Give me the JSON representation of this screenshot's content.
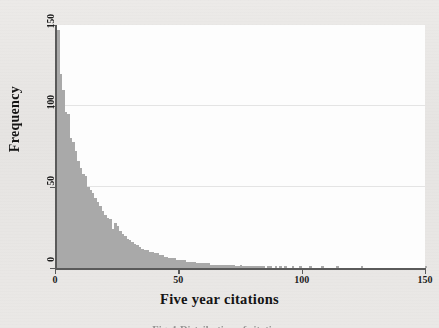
{
  "figure": {
    "caption": "Fig. 1 Distribution of citations",
    "background_color": "#e8e7e5",
    "plot_background_color": "#fdfdfd",
    "bar_color": "#a9a9a9",
    "axis_color": "#5a5a5a"
  },
  "axes": {
    "x_title": "Five year citations",
    "y_title": "Frequency",
    "x_ticks": [
      "0",
      "50",
      "100",
      "150"
    ],
    "y_ticks": [
      "0",
      "50",
      "100",
      "150"
    ]
  },
  "chart_data": {
    "type": "bar",
    "title": "",
    "subtitle": "",
    "xlabel": "Five year citations",
    "ylabel": "Frequency",
    "xlim": [
      0,
      150
    ],
    "ylim": [
      0,
      150
    ],
    "grid": true,
    "gridlines_y": [
      50,
      100
    ],
    "legend": null,
    "legend_position": "none",
    "bin_width": 1,
    "x": [
      0,
      1,
      2,
      3,
      4,
      5,
      6,
      7,
      8,
      9,
      10,
      11,
      12,
      13,
      14,
      15,
      16,
      17,
      18,
      19,
      20,
      21,
      22,
      23,
      24,
      25,
      26,
      27,
      28,
      29,
      30,
      31,
      32,
      33,
      34,
      35,
      36,
      37,
      38,
      39,
      40,
      41,
      42,
      43,
      44,
      45,
      46,
      47,
      48,
      49,
      50,
      51,
      52,
      53,
      54,
      55,
      56,
      57,
      58,
      59,
      60,
      61,
      62,
      63,
      64,
      65,
      66,
      67,
      68,
      69,
      70,
      71,
      72,
      73,
      74,
      75,
      76,
      77,
      78,
      79,
      80,
      81,
      82,
      83,
      84,
      85,
      86,
      87,
      88,
      89,
      90,
      91,
      92,
      93,
      94,
      95,
      96,
      97,
      98,
      99,
      100,
      101,
      102,
      103,
      104,
      105,
      106,
      107,
      108,
      109,
      110,
      111,
      112,
      113,
      114,
      115,
      116,
      117,
      118,
      119,
      120,
      121,
      122,
      123,
      124,
      125,
      126,
      127,
      128,
      129,
      130,
      131,
      132,
      133,
      134,
      135,
      136,
      137,
      138,
      139,
      140,
      141,
      142,
      143,
      144,
      145,
      146,
      147,
      148,
      149,
      150
    ],
    "values": [
      52,
      147,
      120,
      110,
      96,
      95,
      80,
      78,
      72,
      66,
      62,
      58,
      57,
      50,
      48,
      46,
      43,
      41,
      38,
      35,
      33,
      31,
      30,
      24,
      28,
      26,
      23,
      21,
      20,
      18,
      17,
      16,
      15,
      14,
      13,
      12,
      11,
      11,
      10,
      10,
      9,
      9,
      8,
      8,
      7,
      7,
      6,
      6,
      6,
      5,
      5,
      5,
      5,
      4,
      4,
      4,
      4,
      3,
      3,
      3,
      3,
      3,
      3,
      2,
      2,
      2,
      2,
      2,
      2,
      2,
      2,
      2,
      2,
      1,
      1,
      2,
      1,
      1,
      1,
      1,
      1,
      1,
      1,
      1,
      1,
      0,
      1,
      1,
      0,
      1,
      0,
      1,
      0,
      1,
      0,
      0,
      1,
      0,
      0,
      1,
      0,
      0,
      0,
      1,
      0,
      0,
      0,
      0,
      1,
      0,
      0,
      0,
      0,
      0,
      1,
      0,
      0,
      0,
      0,
      0,
      0,
      0,
      0,
      0,
      1,
      0,
      0,
      0,
      0,
      0,
      0,
      0,
      0,
      0,
      0,
      0,
      0,
      0,
      0,
      0,
      0,
      0,
      0,
      0,
      0,
      0,
      0,
      0,
      0,
      0,
      1
    ],
    "peak": {
      "x": 1,
      "y": 147
    },
    "distribution": "right-skewed"
  }
}
